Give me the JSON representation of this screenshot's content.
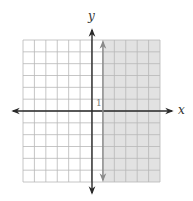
{
  "chart_data": {
    "type": "inequality-graph",
    "title": "",
    "xlabel": "x",
    "ylabel": "y",
    "xlim": [
      -6,
      6
    ],
    "ylim": [
      -6,
      6
    ],
    "grid": true,
    "grid_step": 1,
    "tick_labels": [
      {
        "axis": "y",
        "value": 1,
        "text": "1"
      }
    ],
    "boundary": {
      "type": "vertical-line",
      "x": 1,
      "style": "solid",
      "arrows": "both"
    },
    "shaded_region": {
      "from_x": 1,
      "to_x": 6,
      "from_y": -6,
      "to_y": 6,
      "description": "x ≥ 1"
    },
    "inequality": "x ≥ 1"
  },
  "labels": {
    "x_axis": "x",
    "y_axis": "y",
    "tick_one": "1"
  },
  "colors": {
    "grid": "#b8b8b8",
    "axis": "#2a2a2a",
    "shade": "#e2e2e2",
    "boundary": "#8a8a8a"
  }
}
